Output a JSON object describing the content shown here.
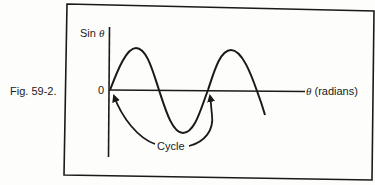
{
  "figure": {
    "caption": "Fig. 59-2.",
    "y_axis_label_prefix": "Sin ",
    "y_axis_label_symbol": "θ",
    "origin_label": "0",
    "x_axis_label_symbol": "θ",
    "x_axis_label_suffix": " (radians)",
    "annotation": "Cycle",
    "stroke_color": "#1a1a1a",
    "background": "#fdfdfb"
  }
}
